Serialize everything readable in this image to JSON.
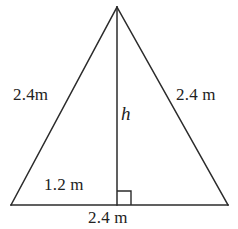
{
  "figure": {
    "name": "isosceles-triangle-with-altitude",
    "background_color": "#ffffff",
    "stroke_color": "#2b2b2b",
    "text_color": "#222222",
    "stroke_width": 1.5,
    "labels": {
      "left_side": "2.4m",
      "right_side": "2.4 m",
      "height": "h",
      "half_base": "1.2 m",
      "base": "2.4 m"
    },
    "geometry": {
      "apex": [
        117,
        7
      ],
      "bottom_left": [
        11,
        205
      ],
      "bottom_right": [
        228,
        205
      ],
      "foot_of_altitude": [
        117,
        205
      ],
      "right_angle_marker": {
        "size": 14,
        "corner": [
          117,
          205
        ],
        "opens": "right"
      }
    },
    "paths": {
      "left_side": "M 11 205 L 117 7",
      "right_side": "M 117 7 L 228 205",
      "base": "M 11 205 L 228 205",
      "altitude": "M 117 7 L 117 205",
      "right_angle": "M 117 191 L 131 191 L 131 205"
    }
  }
}
